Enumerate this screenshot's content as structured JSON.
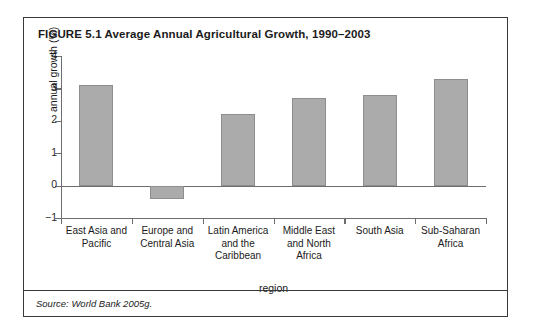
{
  "figure": {
    "title": "FIGURE 5.1  Average Annual Agricultural Growth, 1990–2003",
    "source": "Source: World Bank 2005g."
  },
  "chart_data": {
    "type": "bar",
    "title": "Average Annual Agricultural Growth, 1990–2003",
    "xlabel": "region",
    "ylabel": "annual growth (%)",
    "ylim": [
      -1,
      4
    ],
    "yticks": [
      -1,
      0,
      1,
      2,
      3,
      4
    ],
    "ytick_labels": [
      "−1",
      "0",
      "1",
      "2",
      "3",
      "4"
    ],
    "grid": false,
    "legend": false,
    "bar_color": "#ababab",
    "bar_edge_color": "#8e8e8e",
    "categories": [
      "East Asia and Pacific",
      "Europe and Central Asia",
      "Latin America and the Caribbean",
      "Middle East and North Africa",
      "South Asia",
      "Sub-Saharan Africa"
    ],
    "category_lines": [
      [
        "East Asia and",
        "Pacific"
      ],
      [
        "Europe and",
        "Central Asia"
      ],
      [
        "Latin America",
        "and the",
        "Caribbean"
      ],
      [
        "Middle East",
        "and North",
        "Africa"
      ],
      [
        "South Asia"
      ],
      [
        "Sub-Saharan",
        "Africa"
      ]
    ],
    "values": [
      3.1,
      -0.4,
      2.2,
      2.7,
      2.8,
      3.3
    ]
  }
}
